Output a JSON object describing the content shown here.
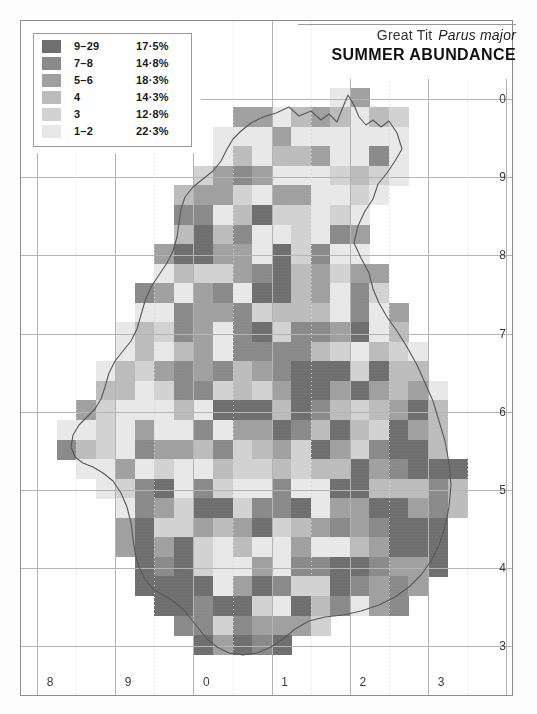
{
  "figure": {
    "type": "distribution-map",
    "title_common": "Great Tit",
    "title_scientific": "Parus major",
    "subtitle": "SUMMER ABUNDANCE"
  },
  "legend": {
    "rows": [
      {
        "category": "9–29",
        "percent": "17·5%",
        "color": "#6f6f6f"
      },
      {
        "category": "7–8",
        "percent": "14·8%",
        "color": "#8a8a8a"
      },
      {
        "category": "5–6",
        "percent": "18·3%",
        "color": "#a0a0a0"
      },
      {
        "category": "4",
        "percent": "14·3%",
        "color": "#bcbcbc"
      },
      {
        "category": "3",
        "percent": "12·8%",
        "color": "#d2d2d2"
      },
      {
        "category": "1–2",
        "percent": "22·3%",
        "color": "#e8e8e8"
      }
    ]
  },
  "axes": {
    "right_labels": [
      "0",
      "9",
      "8",
      "7",
      "6",
      "5",
      "4",
      "3",
      "2"
    ],
    "bottom_labels": [
      "8",
      "9",
      "0",
      "1",
      "2",
      "3"
    ]
  },
  "colors": {
    "frame": "#8d8d8d",
    "grid": "#b4b4b4",
    "grid_minor": "#d8d8d8",
    "coast": "#55585c",
    "background": "#ffffff"
  },
  "chart_data": {
    "type": "heatmap",
    "xlabel": "",
    "ylabel": "",
    "cell_size_px": 19.55,
    "grid_block_cells": 4,
    "value_levels": [
      {
        "label": "9–29",
        "level": 6,
        "share_pct": 17.5
      },
      {
        "label": "7–8",
        "level": 5,
        "share_pct": 14.8
      },
      {
        "label": "5–6",
        "level": 4,
        "share_pct": 18.3
      },
      {
        "label": "4",
        "level": 3,
        "share_pct": 14.3
      },
      {
        "label": "3",
        "level": 2,
        "share_pct": 12.8
      },
      {
        "label": "1–2",
        "level": 1,
        "share_pct": 22.3
      }
    ],
    "legend_position": "top-left",
    "grid": true
  }
}
